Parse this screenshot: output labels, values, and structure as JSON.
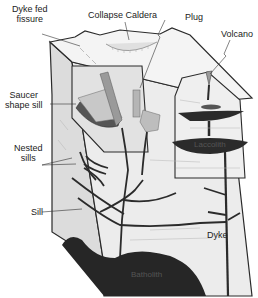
{
  "diagram": {
    "type": "geological block diagram",
    "labels": {
      "dyke_fed_fissure_line1": "Dyke fed",
      "dyke_fed_fissure_line2": "fissure",
      "collapse_caldera": "Collapse Caldera",
      "plug": "Plug",
      "volcano": "Volcano",
      "saucer_sill_line1": "Saucer",
      "saucer_sill_line2": "shape sill",
      "nested_sills_line1": "Nested",
      "nested_sills_line2": "sills",
      "sill": "Sill",
      "dyke": "Dyke",
      "laccolith": "Laccolith",
      "batholith": "Batholith"
    },
    "colors": {
      "outline": "#2a2a2a",
      "intrusion": "#2b2b2b",
      "rock_face": "#e6e6e6",
      "rock_face_side": "#d2d2d2",
      "hatch": "#9a9a9a",
      "volcano_vent": "#9c9c9c"
    }
  }
}
